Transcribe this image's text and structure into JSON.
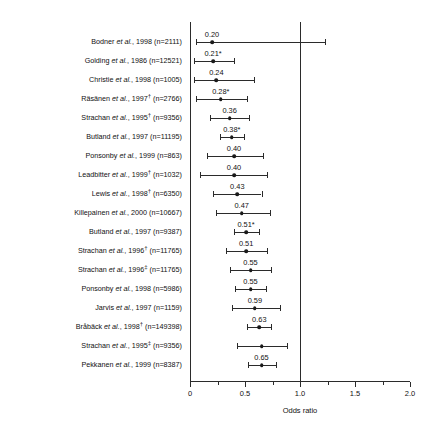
{
  "chart_data": {
    "type": "forest",
    "title": "",
    "xlabel": "Odds ratio",
    "ylabel": "",
    "xlim": [
      0,
      2.0
    ],
    "grid": false,
    "reference_line": 1.0,
    "major_ticks": [
      "0",
      "0.5",
      "1.0",
      "1.5",
      "2.0"
    ],
    "major_tick_values": [
      0,
      0.5,
      1.0,
      1.5,
      2.0
    ],
    "minor_tick_values": [
      0.25,
      0.75,
      1.25,
      1.75
    ],
    "footnote_symbols": [
      "*",
      "†",
      "‡"
    ],
    "studies": [
      {
        "label_author": "Bodner",
        "label_rest": ", 1998 (n=2111)",
        "dagger": "",
        "value": 0.2,
        "value_label": "0.20",
        "ci_low": 0.05,
        "ci_high": 1.23
      },
      {
        "label_author": "Golding",
        "label_rest": ", 1986 (n=12521)",
        "dagger": "",
        "value": 0.21,
        "value_label": "0.21*",
        "ci_low": 0.04,
        "ci_high": 0.4
      },
      {
        "label_author": "Christie",
        "label_rest": ", 1998 (n=1005)",
        "dagger": "",
        "value": 0.24,
        "value_label": "0.24",
        "ci_low": 0.04,
        "ci_high": 0.58
      },
      {
        "label_author": "Räsänen ",
        "label_rest": ", 1997",
        "dagger": "†",
        "label_tail": " (n=2766)",
        "value": 0.28,
        "value_label": "0.28*",
        "ci_low": 0.05,
        "ci_high": 0.52
      },
      {
        "label_author": "Strachan",
        "label_rest": ", 1995",
        "dagger": "†",
        "label_tail": " (n=9356)",
        "value": 0.36,
        "value_label": "0.36",
        "ci_low": 0.18,
        "ci_high": 0.54
      },
      {
        "label_author": "Butland",
        "label_rest": ", 1997 (n=11195)",
        "dagger": "",
        "value": 0.38,
        "value_label": "0.38*",
        "ci_low": 0.27,
        "ci_high": 0.49
      },
      {
        "label_author": "Ponsonby",
        "label_rest": ", 1999 (n=863)",
        "dagger": "",
        "value": 0.4,
        "value_label": "0.40",
        "ci_low": 0.15,
        "ci_high": 0.66
      },
      {
        "label_author": "Leadbitter",
        "label_rest": ", 1999",
        "dagger": "†",
        "label_tail": " (n=1032)",
        "value": 0.4,
        "value_label": "0.40",
        "ci_low": 0.09,
        "ci_high": 0.7
      },
      {
        "label_author": "Lewis",
        "label_rest": ", 1998",
        "dagger": "†",
        "label_tail": " (n=6350)",
        "value": 0.43,
        "value_label": "0.43",
        "ci_low": 0.21,
        "ci_high": 0.65
      },
      {
        "label_author": "Killepainen",
        "label_rest": ", 2000 (n=10667)",
        "dagger": "",
        "value": 0.47,
        "value_label": "0.47",
        "ci_low": 0.24,
        "ci_high": 0.73
      },
      {
        "label_author": "Butland",
        "label_rest": ", 1997 (n=9387)",
        "dagger": "",
        "value": 0.51,
        "value_label": "0.51*",
        "ci_low": 0.4,
        "ci_high": 0.63
      },
      {
        "label_author": "Strachan",
        "label_rest": ", 1996",
        "dagger": "†",
        "label_tail": " (n=11765)",
        "value": 0.51,
        "value_label": "0.51",
        "ci_low": 0.33,
        "ci_high": 0.7
      },
      {
        "label_author": "Strachan",
        "label_rest": ", 1996",
        "dagger": "‡",
        "label_tail": " (n=11765)",
        "value": 0.55,
        "value_label": "0.55",
        "ci_low": 0.36,
        "ci_high": 0.74
      },
      {
        "label_author": "Ponsonby",
        "label_rest": ", 1998 (n=5986)",
        "dagger": "",
        "value": 0.55,
        "value_label": "0.55",
        "ci_low": 0.41,
        "ci_high": 0.69
      },
      {
        "label_author": "Jarvis",
        "label_rest": ", 1997 (n=1159)",
        "dagger": "",
        "value": 0.59,
        "value_label": "0.59",
        "ci_low": 0.38,
        "ci_high": 0.82
      },
      {
        "label_author": "Bråbäck",
        "label_rest": ", 1998",
        "dagger": "†",
        "label_tail": " (n=149398)",
        "value": 0.63,
        "value_label": "0.63",
        "ci_low": 0.52,
        "ci_high": 0.74
      },
      {
        "label_author": "Strachan",
        "label_rest": ", 1995",
        "dagger": "‡",
        "label_tail": " (n=9356)",
        "value": 0.65,
        "value_label": "",
        "ci_low": 0.43,
        "ci_high": 0.88
      },
      {
        "label_author": "Pekkanen",
        "label_rest": ", 1999 (n=8387)",
        "dagger": "",
        "value": 0.65,
        "value_label": "0.65",
        "ci_low": 0.53,
        "ci_high": 0.78
      }
    ]
  }
}
